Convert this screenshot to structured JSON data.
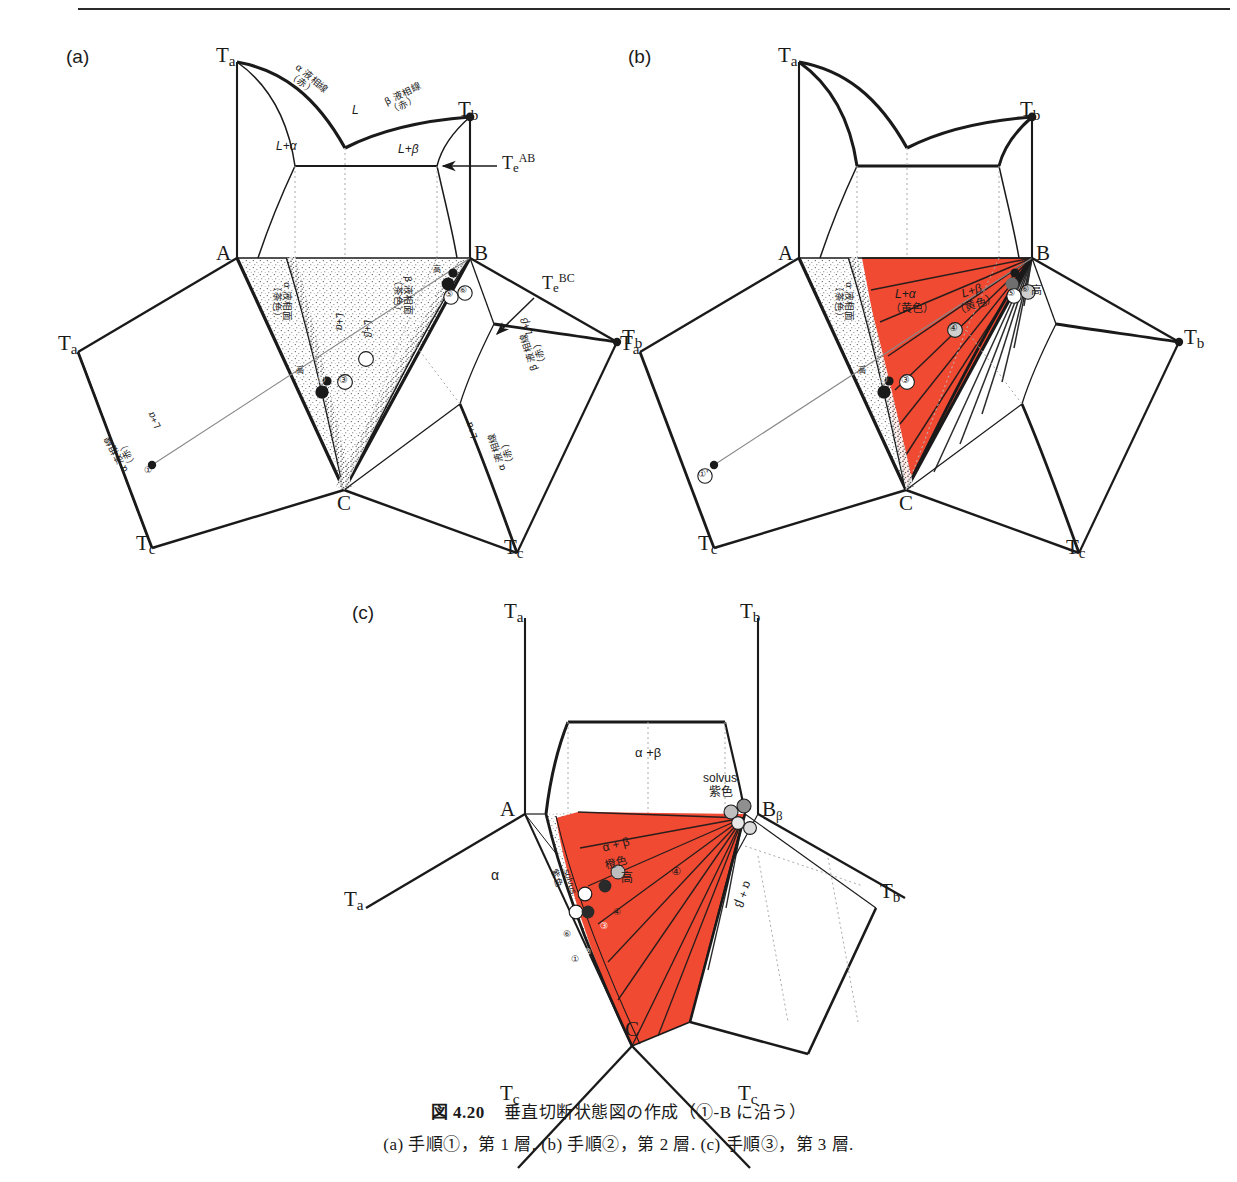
{
  "figure": {
    "caption_main": "図 4.20　垂直切断状態図の作成（①-B に沿う）",
    "caption_sub": "(a) 手順①，第 1 層.  (b) 手順②，第 2 層.  (c) 手順③，第 3 層.",
    "caption_number": "図 4.20",
    "caption_title": "垂直切断状態図の作成（①-B に沿う）"
  },
  "colors": {
    "red_fill": "#F04A33",
    "red_line": "#C02A16",
    "ink": "#1a1a1a",
    "stipple": "#555555",
    "paper": "#ffffff",
    "dotted": "#9a9a9a"
  },
  "panels": [
    {
      "id": "a",
      "label": "(a)",
      "vertices": {
        "A": "A",
        "B": "B",
        "C": "C"
      },
      "temps": {
        "Ta_top": "Ta",
        "Tb_top": "Tb",
        "Ta_left": "Ta",
        "Tc_left": "Tc",
        "Tb_right": "Tb",
        "Tc_right": "Tc"
      },
      "eutectics": {
        "e_ab": "Te",
        "e_ab_sup": "AB",
        "e_bc": "Te",
        "e_bc_sup": "BC"
      },
      "fields": {
        "liquid": "L",
        "l_alpha": "L+α",
        "l_beta": "L+β",
        "l_alpha_bc": "L+α",
        "l_beta_bc": "L+β",
        "l_alpha_ac": "L+α"
      },
      "curve_labels": [
        {
          "name": "alpha-liquidus-ab",
          "text": "α 液相線\n（赤）"
        },
        {
          "name": "beta-liquidus-ab",
          "text": "β 液相線\n（赤）"
        },
        {
          "name": "alpha-liquidus-surface",
          "text": "α 液相面\n（茶色）"
        },
        {
          "name": "beta-liquidus-surface",
          "text": "β 液相面\n（茶色）"
        },
        {
          "name": "beta-liquidus-bc",
          "text": "β 液相線\n（赤）"
        },
        {
          "name": "alpha-liquidus-ac",
          "text": "α 液相線\n（赤）"
        }
      ],
      "markers": [
        "①",
        "②",
        "③",
        "⑤",
        "⑥"
      ],
      "tick_marks": [
        "高",
        "高",
        "高"
      ]
    },
    {
      "id": "b",
      "label": "(b)",
      "vertices": {
        "A": "A",
        "B": "B",
        "C": "C"
      },
      "temps": {
        "Ta_top": "Ta",
        "Tb_top": "Tb",
        "Ta_left": "Ta",
        "Tc_left": "Tc",
        "Tb_right": "Tb",
        "Tc_right": "Tc"
      },
      "fields": {
        "l_alpha": "L+α",
        "l_alpha_color": "（黄色）",
        "l_beta": "L+β",
        "l_beta_color": "（黄色）"
      },
      "curve_labels": [
        {
          "name": "alpha-liquidus-surface",
          "text": "α 液相面\n（茶色）"
        }
      ],
      "markers": [
        "①'",
        "①",
        "②",
        "③",
        "④",
        "⑤",
        "⑥"
      ],
      "tick_marks": [
        "高",
        "高",
        "高"
      ]
    },
    {
      "id": "c",
      "label": "(c)",
      "vertices": {
        "A": "A",
        "B": "B",
        "B_sub": "β",
        "C": "C"
      },
      "temps": {
        "Ta_top": "Ta",
        "Tb_top": "Tb",
        "Ta_left": "Ta",
        "Tc_left": "Tc",
        "Tb_right": "Tb",
        "Tc_right": "Tc"
      },
      "fields": {
        "alpha_beta_top": "α +β",
        "alpha_beta_red": "α + β",
        "alpha_beta_red_color": "橙色",
        "alpha": "α",
        "alpha_beta_right": "α + β"
      },
      "curve_labels": [
        {
          "name": "solvus-top",
          "text": "solvus\n紫色"
        },
        {
          "name": "solvus-left",
          "text": "solvus\n紫色"
        }
      ],
      "markers": [
        "①",
        "②",
        "③",
        "④",
        "⑤",
        "⑥"
      ],
      "tick_marks": [
        "高"
      ]
    }
  ]
}
